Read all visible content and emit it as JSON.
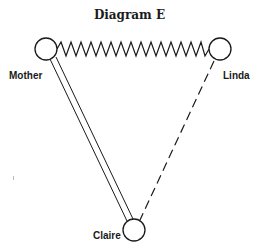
{
  "diagram": {
    "title": "Diagram E",
    "nodes": [
      {
        "id": "mother",
        "label": "Mother",
        "cx": 46,
        "cy": 49,
        "r": 11
      },
      {
        "id": "linda",
        "label": "Linda",
        "cx": 220,
        "cy": 49,
        "r": 11
      },
      {
        "id": "claire",
        "label": "Claire",
        "cx": 134,
        "cy": 230,
        "r": 11
      }
    ],
    "edges": [
      {
        "from": "mother",
        "to": "linda",
        "style": "zigzag"
      },
      {
        "from": "mother",
        "to": "claire",
        "style": "double-line"
      },
      {
        "from": "linda",
        "to": "claire",
        "style": "dashed"
      }
    ],
    "stroke_color": "#1a1a1a"
  }
}
